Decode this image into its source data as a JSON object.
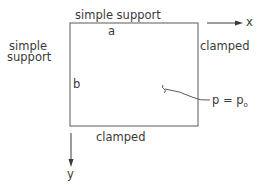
{
  "diagram": {
    "edges": {
      "top": "simple support",
      "left_line1": "simple",
      "left_line2": "support",
      "right": "clamped",
      "bottom": "clamped"
    },
    "dimensions": {
      "width_label": "a",
      "height_label": "b"
    },
    "axes": {
      "x": "x",
      "y": "y"
    },
    "load": {
      "label": "p = p",
      "subscript": "o"
    },
    "colors": {
      "line": "#5a5a5a",
      "text": "#3a3a3a"
    }
  }
}
